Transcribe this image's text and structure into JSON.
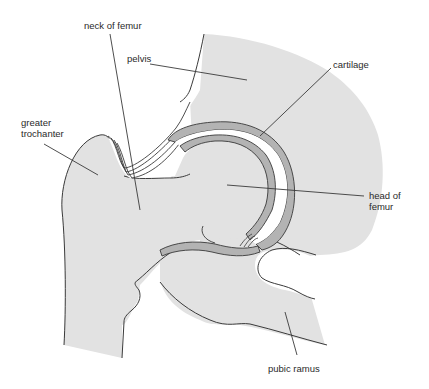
{
  "diagram": {
    "colors": {
      "bone_fill": "#e2e2e2",
      "cartilage_fill": "#b3b3b3",
      "joint_space": "#ffffff",
      "outline": "#3a3a3a",
      "leader_line": "#3a3a3a"
    },
    "labels": [
      {
        "id": "neck-of-femur",
        "text": "neck of femur",
        "x": 84,
        "y": 20
      },
      {
        "id": "pelvis",
        "text": "pelvis",
        "x": 127,
        "y": 53
      },
      {
        "id": "cartilage",
        "text": "cartilage",
        "x": 333,
        "y": 59
      },
      {
        "id": "greater-trochanter",
        "text": "greater\ntrochanter",
        "x": 21,
        "y": 117
      },
      {
        "id": "head-of-femur",
        "text": "head of\nfemur",
        "x": 369,
        "y": 190
      },
      {
        "id": "pubic-ramus",
        "text": "pubic ramus",
        "x": 268,
        "y": 363
      }
    ]
  }
}
